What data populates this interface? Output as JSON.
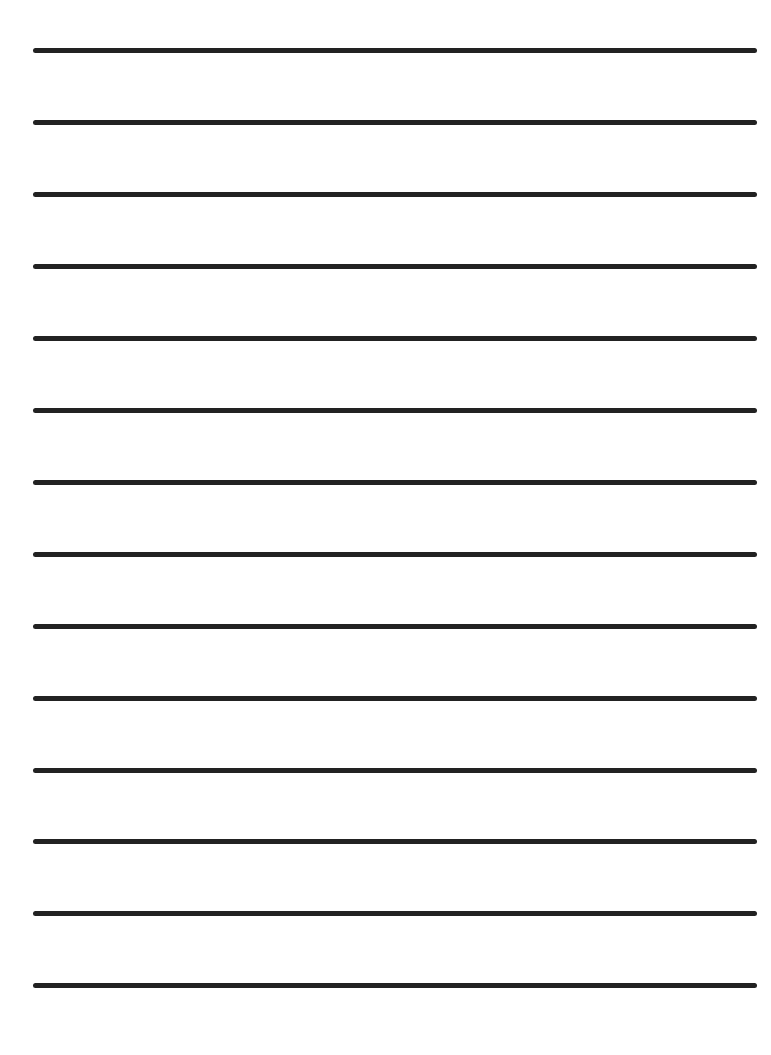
{
  "paper": {
    "type": "lined-paper",
    "background_color": "#ffffff",
    "line_color": "#222222",
    "line_count": 14,
    "line_left": 33,
    "line_width": 724,
    "line_thickness": 5,
    "line_positions_y": [
      48,
      120,
      192,
      264,
      336,
      408,
      480,
      552,
      624,
      696,
      768,
      839,
      911,
      983
    ]
  }
}
